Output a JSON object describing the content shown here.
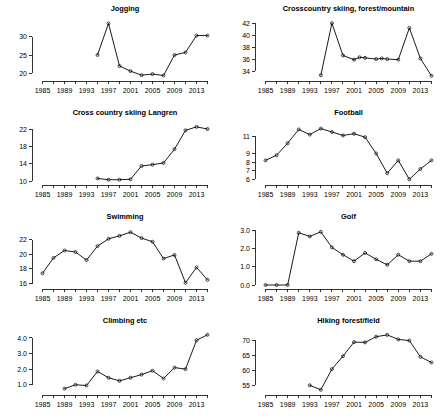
{
  "figure": {
    "name": "sports-participation-small-multiples",
    "layout": {
      "rows": 4,
      "cols": 2
    },
    "background_color": "#ffffff",
    "line_color": "#000000",
    "point_symbol": "open-circle"
  },
  "chart_data": [
    {
      "type": "line",
      "title": "Jogging",
      "xlabel": "",
      "ylabel": "",
      "grid": false,
      "legend": "none",
      "xlim": [
        1984,
        2016
      ],
      "ylim": [
        19,
        34
      ],
      "xticks": [
        1985,
        1987,
        1989,
        1991,
        1993,
        1995,
        1997,
        1999,
        2001,
        2003,
        2005,
        2007,
        2009,
        2011,
        2013,
        2015
      ],
      "xticklabels": [
        "1985",
        "",
        "1989",
        "",
        "1993",
        "",
        "1997",
        "",
        "2001",
        "",
        "2005",
        "",
        "2009",
        "",
        "2013",
        ""
      ],
      "yticks": [
        20,
        25,
        30
      ],
      "yticklabels": [
        "20",
        "25",
        "30"
      ],
      "x": [
        1995,
        1997,
        1999,
        2001,
        2003,
        2005,
        2007,
        2009,
        2011,
        2013,
        2015
      ],
      "values": [
        25.0,
        33.6,
        22.0,
        20.6,
        19.5,
        19.8,
        19.4,
        25.0,
        25.7,
        30.3,
        30.3
      ]
    },
    {
      "type": "line",
      "title": "Crosscountry skiing, forest/mountain",
      "xlabel": "",
      "ylabel": "",
      "grid": false,
      "legend": "none",
      "xlim": [
        1984,
        2016
      ],
      "ylim": [
        33,
        42.2
      ],
      "xticks": [
        1985,
        1987,
        1989,
        1991,
        1993,
        1995,
        1997,
        1999,
        2001,
        2003,
        2005,
        2007,
        2009,
        2011,
        2013,
        2015
      ],
      "xticklabels": [
        "1985",
        "",
        "1989",
        "",
        "1993",
        "",
        "1997",
        "",
        "2001",
        "",
        "2005",
        "",
        "2009",
        "",
        "2013",
        ""
      ],
      "yticks": [
        34,
        36,
        38,
        40,
        42
      ],
      "yticklabels": [
        "34",
        "36",
        "38",
        "40",
        "42"
      ],
      "x": [
        1995,
        1997,
        1999,
        2001,
        2002,
        2003,
        2005,
        2006,
        2007,
        2009,
        2011,
        2013,
        2015
      ],
      "values": [
        33.3,
        42.0,
        36.6,
        35.9,
        36.3,
        36.2,
        36.0,
        36.1,
        36.0,
        35.9,
        41.2,
        36.1,
        33.2
      ]
    },
    {
      "type": "line",
      "title": "Cross country skiing Langren",
      "xlabel": "",
      "ylabel": "",
      "grid": false,
      "legend": "none",
      "xlim": [
        1984,
        2016
      ],
      "ylim": [
        10,
        22.8
      ],
      "xticks": [
        1985,
        1987,
        1989,
        1991,
        1993,
        1995,
        1997,
        1999,
        2001,
        2003,
        2005,
        2007,
        2009,
        2011,
        2013,
        2015
      ],
      "xticklabels": [
        "1985",
        "",
        "1989",
        "",
        "1993",
        "",
        "1997",
        "",
        "2001",
        "",
        "2005",
        "",
        "2009",
        "",
        "2013",
        ""
      ],
      "yticks": [
        10,
        14,
        18,
        22
      ],
      "yticklabels": [
        "10",
        "14",
        "18",
        "22"
      ],
      "x": [
        1995,
        1997,
        1999,
        2001,
        2003,
        2005,
        2007,
        2009,
        2011,
        2013,
        2015
      ],
      "values": [
        10.6,
        10.3,
        10.3,
        10.4,
        13.5,
        13.8,
        14.2,
        17.4,
        21.8,
        22.6,
        22.1
      ]
    },
    {
      "type": "line",
      "title": "Football",
      "xlabel": "",
      "ylabel": "",
      "grid": false,
      "legend": "none",
      "xlim": [
        1984,
        2016
      ],
      "ylim": [
        5.8,
        12.2
      ],
      "xticks": [
        1985,
        1987,
        1989,
        1991,
        1993,
        1995,
        1997,
        1999,
        2001,
        2003,
        2005,
        2007,
        2009,
        2011,
        2013,
        2015
      ],
      "xticklabels": [
        "1985",
        "",
        "1989",
        "",
        "1993",
        "",
        "1997",
        "",
        "2001",
        "",
        "2005",
        "",
        "2009",
        "",
        "2013",
        ""
      ],
      "yticks": [
        6,
        7,
        8,
        9,
        11
      ],
      "yticklabels": [
        "6",
        "7",
        "8",
        "9",
        "11"
      ],
      "x": [
        1985,
        1987,
        1989,
        1991,
        1993,
        1995,
        1997,
        1999,
        2001,
        2003,
        2005,
        2007,
        2009,
        2011,
        2013,
        2015
      ],
      "values": [
        8.2,
        8.8,
        10.2,
        11.8,
        11.2,
        11.9,
        11.5,
        11.1,
        11.3,
        10.9,
        9.0,
        6.7,
        8.2,
        6.0,
        7.2,
        8.2
      ]
    },
    {
      "type": "line",
      "title": "Swimming",
      "xlabel": "",
      "ylabel": "",
      "grid": false,
      "legend": "none",
      "xlim": [
        1984,
        2016
      ],
      "ylim": [
        15.8,
        23.3
      ],
      "xticks": [
        1985,
        1987,
        1989,
        1991,
        1993,
        1995,
        1997,
        1999,
        2001,
        2003,
        2005,
        2007,
        2009,
        2011,
        2013,
        2015
      ],
      "xticklabels": [
        "1985",
        "",
        "1989",
        "",
        "1993",
        "",
        "1997",
        "",
        "2001",
        "",
        "2005",
        "",
        "2009",
        "",
        "2013",
        ""
      ],
      "yticks": [
        16,
        18,
        20,
        22
      ],
      "yticklabels": [
        "16",
        "18",
        "20",
        "22"
      ],
      "x": [
        1985,
        1987,
        1989,
        1991,
        1993,
        1995,
        1997,
        1999,
        2001,
        2003,
        2005,
        2007,
        2009,
        2011,
        2013,
        2015
      ],
      "values": [
        17.4,
        19.5,
        20.5,
        20.3,
        19.2,
        21.1,
        22.1,
        22.5,
        23.0,
        22.2,
        21.7,
        19.4,
        19.9,
        16.1,
        18.2,
        16.5
      ]
    },
    {
      "type": "line",
      "title": "Golf",
      "xlabel": "",
      "ylabel": "",
      "grid": false,
      "legend": "none",
      "xlim": [
        1984,
        2016
      ],
      "ylim": [
        0,
        3.0
      ],
      "xticks": [
        1985,
        1987,
        1989,
        1991,
        1993,
        1995,
        1997,
        1999,
        2001,
        2003,
        2005,
        2007,
        2009,
        2011,
        2013,
        2015
      ],
      "xticklabels": [
        "1985",
        "",
        "1989",
        "",
        "1993",
        "",
        "1997",
        "",
        "2001",
        "",
        "2005",
        "",
        "2009",
        "",
        "2013",
        ""
      ],
      "yticks": [
        0.0,
        1.0,
        2.0,
        3.0
      ],
      "yticklabels": [
        "0.0",
        "1.0",
        "2.0",
        "3.0"
      ],
      "x": [
        1985,
        1987,
        1989,
        1991,
        1993,
        1995,
        1997,
        1999,
        2001,
        2003,
        2005,
        2007,
        2009,
        2011,
        2013,
        2015
      ],
      "values": [
        0.0,
        0.0,
        0.0,
        2.85,
        2.65,
        2.9,
        2.05,
        1.65,
        1.3,
        1.75,
        1.4,
        1.1,
        1.65,
        1.3,
        1.3,
        1.7
      ]
    },
    {
      "type": "line",
      "title": "Climbing etc",
      "xlabel": "",
      "ylabel": "",
      "grid": false,
      "legend": "none",
      "xlim": [
        1984,
        2016
      ],
      "ylim": [
        0.6,
        4.25
      ],
      "xticks": [
        1985,
        1987,
        1989,
        1991,
        1993,
        1995,
        1997,
        1999,
        2001,
        2003,
        2005,
        2007,
        2009,
        2011,
        2013,
        2015
      ],
      "xticklabels": [
        "1985",
        "",
        "1989",
        "",
        "1993",
        "",
        "1997",
        "",
        "2001",
        "",
        "2005",
        "",
        "2009",
        "",
        "2013",
        ""
      ],
      "yticks": [
        1.0,
        2.0,
        3.0,
        4.0
      ],
      "yticklabels": [
        "1.0",
        "2.0",
        "3.0",
        "4.0"
      ],
      "x": [
        1989,
        1991,
        1993,
        1995,
        1997,
        1999,
        2001,
        2003,
        2005,
        2007,
        2009,
        2011,
        2013,
        2015
      ],
      "values": [
        0.75,
        1.0,
        0.95,
        1.85,
        1.45,
        1.25,
        1.45,
        1.65,
        1.9,
        1.4,
        2.1,
        2.0,
        3.85,
        4.2
      ]
    },
    {
      "type": "line",
      "title": "Hiking forest/field",
      "xlabel": "",
      "ylabel": "",
      "grid": false,
      "legend": "none",
      "xlim": [
        1984,
        2016
      ],
      "ylim": [
        53,
        72
      ],
      "xticks": [
        1985,
        1987,
        1989,
        1991,
        1993,
        1995,
        1997,
        1999,
        2001,
        2003,
        2005,
        2007,
        2009,
        2011,
        2013,
        2015
      ],
      "xticklabels": [
        "1985",
        "",
        "1989",
        "",
        "1993",
        "",
        "1997",
        "",
        "2001",
        "",
        "2005",
        "",
        "2009",
        "",
        "2013",
        ""
      ],
      "yticks": [
        55,
        60,
        65,
        70
      ],
      "yticklabels": [
        "55",
        "60",
        "65",
        "70"
      ],
      "x": [
        1993,
        1995,
        1997,
        1999,
        2001,
        2003,
        2005,
        2007,
        2009,
        2011,
        2013,
        2015
      ],
      "values": [
        54.9,
        53.4,
        60.3,
        64.6,
        69.3,
        69.2,
        71.1,
        71.7,
        70.2,
        69.8,
        64.4,
        62.5
      ]
    }
  ]
}
